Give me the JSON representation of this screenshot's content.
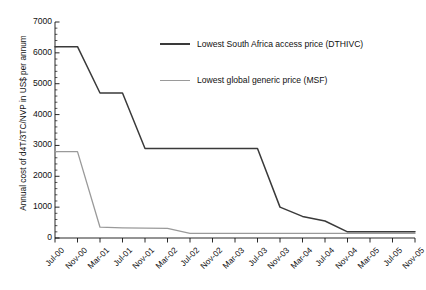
{
  "chart_data": {
    "type": "line",
    "title": "",
    "xlabel": "",
    "ylabel": "Annual cost of d4T/3TC/NVP in US$ per annum",
    "ylim": [
      0,
      7000
    ],
    "ytick_values": [
      0,
      1000,
      2000,
      3000,
      4000,
      5000,
      6000,
      7000
    ],
    "ytick_labels": [
      "0",
      "1000",
      "2000",
      "3000",
      "4000",
      "5000",
      "6000",
      "7000"
    ],
    "minor_ticks": true,
    "grid": false,
    "legend_position": "upper-center",
    "categories": [
      "Jul-00",
      "Nov-00",
      "Mar-01",
      "Jul-01",
      "Nov-01",
      "Mar-02",
      "Jul-02",
      "Nov-02",
      "Mar-03",
      "Jul-03",
      "Nov-03",
      "Mar-04",
      "Jul-04",
      "Nov-04",
      "Mar-05",
      "Jul-05",
      "Nov-05"
    ],
    "series": [
      {
        "name": "Lowest South Africa access price (DTHIVC)",
        "color": "#3a3a3a",
        "values": [
          6200,
          6200,
          4700,
          4700,
          2900,
          2900,
          2900,
          2900,
          2900,
          2900,
          1000,
          700,
          550,
          200,
          200,
          200,
          200
        ]
      },
      {
        "name": "Lowest global generic price (MSF)",
        "color": "#9a9a9a",
        "values": [
          2800,
          2800,
          350,
          330,
          320,
          310,
          150,
          150,
          150,
          150,
          150,
          150,
          150,
          150,
          150,
          150,
          150
        ]
      }
    ]
  },
  "legend": {
    "items": [
      {
        "label": "Lowest South Africa access price (DTHIVC)",
        "style": "dark"
      },
      {
        "label": "Lowest global generic price (MSF)",
        "style": "gray"
      }
    ]
  },
  "caption": {
    "text": ""
  }
}
